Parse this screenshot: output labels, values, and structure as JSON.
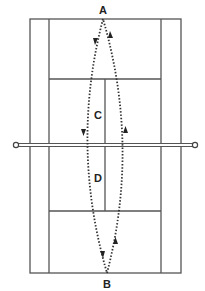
{
  "diagram": {
    "type": "tennis-court-drill",
    "colors": {
      "lines": "#555555",
      "path": "#333333",
      "background": "#ffffff",
      "labels": "#222222"
    },
    "labels": {
      "A": {
        "text": "A",
        "x": 103,
        "y": 14
      },
      "B": {
        "text": "B",
        "x": 107,
        "y": 288
      },
      "C": {
        "text": "C",
        "x": 98,
        "y": 119
      },
      "D": {
        "text": "D",
        "x": 98,
        "y": 182
      }
    },
    "court": {
      "outer": {
        "x1": 30,
        "y1": 19,
        "x2": 181,
        "y2": 273
      },
      "singles_left_x": 49,
      "singles_right_x": 161,
      "service_line_top_y": 79,
      "service_line_bottom_y": 211,
      "center_service_x": 105,
      "net": {
        "y": 145,
        "left_post_x": 16,
        "right_post_x": 195
      }
    },
    "paths": [
      {
        "name": "A-to-B-left",
        "from": "A",
        "via": "C",
        "to": "B",
        "direction": "down"
      },
      {
        "name": "B-to-A-right",
        "from": "B",
        "via": "D",
        "to": "A",
        "direction": "up"
      }
    ]
  }
}
